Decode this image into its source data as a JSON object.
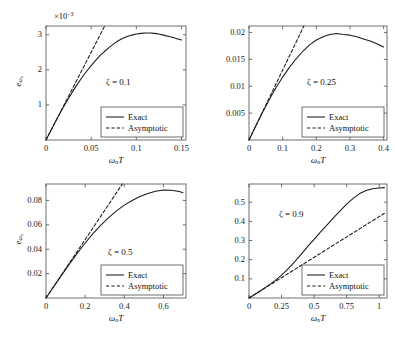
{
  "figure": {
    "type": "multi-panel-line-chart",
    "panel_count": 4,
    "layout": "2x2",
    "shared_xlabel": "ωₙT",
    "shared_ylabel": "eωₙ",
    "legend_entries": [
      "Exact",
      "Asymptotic"
    ]
  },
  "chart_data": [
    {
      "id": "panel-zeta-0p1",
      "type": "line",
      "title": "",
      "annotation": "ζ = 0.1",
      "zeta": 0.1,
      "xlabel": "ωₙT",
      "ylabel": "eωₙ",
      "y_exponent_label": "×10⁻³",
      "y_scale": 0.001,
      "xlim": [
        0,
        0.155
      ],
      "ylim": [
        0,
        3.25
      ],
      "xticks": [
        0,
        0.05,
        0.1,
        0.15
      ],
      "xticklabels": [
        "0",
        "0.05",
        "0.1",
        "0.15"
      ],
      "yticks": [
        1,
        2,
        3
      ],
      "yticklabels": [
        "1",
        "2",
        "3"
      ],
      "grid": false,
      "legend_position": "lower-right",
      "series": [
        {
          "name": "Exact",
          "style": "solid",
          "x": [
            0,
            0.005,
            0.01,
            0.015,
            0.02,
            0.025,
            0.03,
            0.035,
            0.04,
            0.045,
            0.05,
            0.055,
            0.06,
            0.065,
            0.07,
            0.075,
            0.08,
            0.085,
            0.09,
            0.095,
            0.1,
            0.105,
            0.11,
            0.115,
            0.12,
            0.125,
            0.13,
            0.135,
            0.14,
            0.145,
            0.15
          ],
          "y": [
            0,
            0.25,
            0.5,
            0.74,
            0.97,
            1.19,
            1.4,
            1.6,
            1.79,
            1.96,
            2.12,
            2.27,
            2.41,
            2.53,
            2.64,
            2.74,
            2.83,
            2.9,
            2.95,
            2.99,
            3.02,
            3.04,
            3.05,
            3.05,
            3.04,
            3.02,
            2.99,
            2.96,
            2.93,
            2.89,
            2.85
          ]
        },
        {
          "name": "Asymptotic",
          "style": "dashed",
          "x": [
            0,
            0.01,
            0.02,
            0.03,
            0.04,
            0.05,
            0.06,
            0.065
          ],
          "y": [
            0,
            0.5,
            1.0,
            1.5,
            2.0,
            2.5,
            3.0,
            3.25
          ]
        }
      ]
    },
    {
      "id": "panel-zeta-0p25",
      "type": "line",
      "title": "",
      "annotation": "ζ = 0.25",
      "zeta": 0.25,
      "xlabel": "ωₙT",
      "ylabel": "eωₙ",
      "y_exponent_label": "",
      "y_scale": 1,
      "xlim": [
        0,
        0.41
      ],
      "ylim": [
        0,
        0.0212
      ],
      "xticks": [
        0,
        0.1,
        0.2,
        0.3,
        0.4
      ],
      "xticklabels": [
        "0",
        "0.1",
        "0.2",
        "0.3",
        "0.4"
      ],
      "yticks": [
        0.005,
        0.01,
        0.015,
        0.02
      ],
      "yticklabels": [
        "0.005",
        "0.01",
        "0.015",
        "0.02"
      ],
      "grid": false,
      "legend_position": "lower-right",
      "series": [
        {
          "name": "Exact",
          "style": "solid",
          "x": [
            0,
            0.02,
            0.04,
            0.06,
            0.08,
            0.1,
            0.12,
            0.14,
            0.16,
            0.18,
            0.2,
            0.22,
            0.24,
            0.26,
            0.28,
            0.3,
            0.32,
            0.34,
            0.36,
            0.38,
            0.4
          ],
          "y": [
            0,
            0.0026,
            0.0051,
            0.0075,
            0.0097,
            0.0117,
            0.0135,
            0.0151,
            0.0165,
            0.0177,
            0.0186,
            0.0192,
            0.0196,
            0.0198,
            0.0196,
            0.0195,
            0.0192,
            0.0188,
            0.0184,
            0.0179,
            0.0173
          ]
        },
        {
          "name": "Asymptotic",
          "style": "dashed",
          "x": [
            0,
            0.03,
            0.06,
            0.09,
            0.12,
            0.15,
            0.163
          ],
          "y": [
            0,
            0.0039,
            0.0078,
            0.0117,
            0.0156,
            0.0195,
            0.0212
          ]
        }
      ]
    },
    {
      "id": "panel-zeta-0p5",
      "type": "line",
      "title": "",
      "annotation": "ζ = 0.5",
      "zeta": 0.5,
      "xlabel": "ωₙT",
      "ylabel": "eωₙ",
      "y_exponent_label": "",
      "y_scale": 1,
      "xlim": [
        0,
        0.715
      ],
      "ylim": [
        0,
        0.0935
      ],
      "xticks": [
        0,
        0.2,
        0.4,
        0.6
      ],
      "xticklabels": [
        "0",
        "0.2",
        "0.4",
        "0.6"
      ],
      "yticks": [
        0.02,
        0.04,
        0.06,
        0.08
      ],
      "yticklabels": [
        "0.02",
        "0.04",
        "0.06",
        "0.08"
      ],
      "grid": false,
      "legend_position": "lower-right",
      "series": [
        {
          "name": "Exact",
          "style": "solid",
          "x": [
            0,
            0.04,
            0.08,
            0.12,
            0.16,
            0.2,
            0.24,
            0.28,
            0.32,
            0.36,
            0.4,
            0.44,
            0.48,
            0.52,
            0.56,
            0.6,
            0.64,
            0.68,
            0.7
          ],
          "y": [
            0,
            0.0094,
            0.0188,
            0.028,
            0.0368,
            0.0451,
            0.0528,
            0.0598,
            0.066,
            0.0714,
            0.0762,
            0.08,
            0.0833,
            0.0858,
            0.0876,
            0.0886,
            0.0884,
            0.0873,
            0.0864
          ]
        },
        {
          "name": "Asymptotic",
          "style": "dashed",
          "x": [
            0,
            0.07,
            0.14,
            0.21,
            0.28,
            0.35,
            0.39
          ],
          "y": [
            0,
            0.0168,
            0.0336,
            0.0503,
            0.0671,
            0.0839,
            0.0935
          ]
        }
      ]
    },
    {
      "id": "panel-zeta-0p9",
      "type": "line",
      "title": "",
      "annotation": "ζ = 0.9",
      "zeta": 0.9,
      "xlabel": "ωₙT",
      "ylabel": "eωₙ",
      "y_exponent_label": "",
      "y_scale": 1,
      "xlim": [
        0,
        1.06
      ],
      "ylim": [
        0,
        0.595
      ],
      "xticks": [
        0,
        0.25,
        0.5,
        0.75,
        1
      ],
      "xticklabels": [
        "0",
        "0.25",
        "0.5",
        "0.75",
        "1"
      ],
      "yticks": [
        0.1,
        0.2,
        0.3,
        0.4,
        0.5
      ],
      "yticklabels": [
        "0.1",
        "0.2",
        "0.3",
        "0.4",
        "0.5"
      ],
      "grid": false,
      "legend_position": "lower-right",
      "series": [
        {
          "name": "Exact",
          "style": "solid",
          "x": [
            0,
            0.05,
            0.1,
            0.15,
            0.2,
            0.25,
            0.3,
            0.35,
            0.4,
            0.45,
            0.5,
            0.55,
            0.6,
            0.65,
            0.7,
            0.75,
            0.8,
            0.85,
            0.9,
            0.95,
            1.0,
            1.04
          ],
          "y": [
            0,
            0.021,
            0.043,
            0.066,
            0.091,
            0.119,
            0.152,
            0.189,
            0.228,
            0.268,
            0.306,
            0.345,
            0.382,
            0.419,
            0.455,
            0.49,
            0.52,
            0.545,
            0.561,
            0.57,
            0.574,
            0.576
          ]
        },
        {
          "name": "Asymptotic",
          "style": "dashed",
          "x": [
            0,
            0.1,
            0.2,
            0.3,
            0.4,
            0.5,
            0.6,
            0.7,
            0.8,
            0.9,
            1.0,
            1.04
          ],
          "y": [
            0,
            0.0425,
            0.085,
            0.1275,
            0.17,
            0.2125,
            0.255,
            0.2975,
            0.34,
            0.3825,
            0.425,
            0.442
          ]
        }
      ]
    }
  ],
  "colors": {
    "axis": "#4d4d4d",
    "curve": "#1a1a1a",
    "text": "#111111",
    "background": "#ffffff"
  }
}
